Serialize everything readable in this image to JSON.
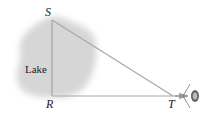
{
  "diagram": {
    "region_label": "Lake",
    "points": {
      "S": "S",
      "R": "R",
      "T": "T"
    },
    "instrument": "surveying-transit",
    "colors": {
      "lake_fill": "#dcdcdc",
      "lines": "#9a9a9a",
      "text": "#222222"
    }
  }
}
